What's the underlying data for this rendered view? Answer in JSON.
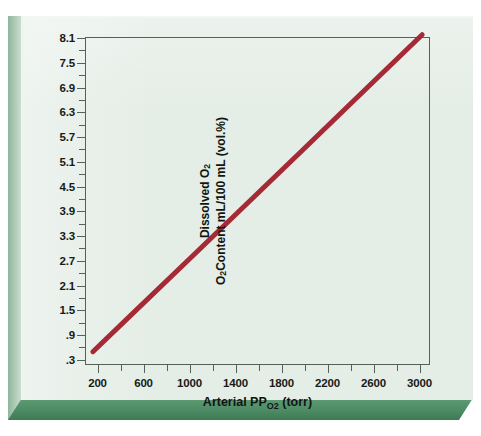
{
  "figure": {
    "background_color": "#e4ede6",
    "bevel_color": "#4b8a63",
    "frame_color": "#54605a"
  },
  "chart_data": {
    "type": "line",
    "title": "",
    "xlabel": "Arterial PO2 (torr)",
    "ylabel": "Dissolved O2 / O2 Content mL/100 mL (vol.%)",
    "ylabel_line1": "Dissolved O",
    "ylabel_line1_sub": "2",
    "ylabel_line2_pre": "O",
    "ylabel_line2_sub": "2",
    "ylabel_line2_post": " Content mL/100 mL (vol.%)",
    "xlabel_pre": "Arterial P",
    "xlabel_sub": "O2",
    "xlabel_post": " (torr)",
    "xlim": [
      100,
      3100
    ],
    "ylim": [
      0.15,
      8.1
    ],
    "xticks": [
      200,
      400,
      600,
      800,
      1000,
      1200,
      1400,
      1600,
      1800,
      2000,
      2200,
      2400,
      2600,
      2800,
      3000
    ],
    "xtick_labels": [
      "200",
      "",
      "600",
      "",
      "1000",
      "",
      "1400",
      "",
      "1800",
      "",
      "2200",
      "",
      "2600",
      "",
      "3000"
    ],
    "yticks": [
      0.3,
      0.6,
      0.9,
      1.2,
      1.5,
      1.8,
      2.1,
      2.4,
      2.7,
      3.0,
      3.3,
      3.6,
      3.9,
      4.2,
      4.5,
      4.8,
      5.1,
      5.4,
      5.7,
      6.0,
      6.3,
      6.6,
      6.9,
      7.2,
      7.5,
      7.8,
      8.1
    ],
    "ytick_labels": [
      ".3",
      "",
      ".9",
      "",
      "1.5",
      "",
      "2.1",
      "",
      "2.7",
      "",
      "3.3",
      "",
      "3.9",
      "",
      "4.5",
      "",
      "5.1",
      "",
      "5.7",
      "",
      "6.3",
      "",
      "6.9",
      "",
      "7.5",
      "",
      "8.1"
    ],
    "grid": false,
    "legend": "none",
    "series": [
      {
        "name": "Dissolved O2 content",
        "color": "#a52a35",
        "line_width": 5,
        "x": [
          160,
          500,
          1000,
          1500,
          2000,
          2500,
          3040
        ],
        "y": [
          0.45,
          1.36,
          2.7,
          4.04,
          5.38,
          6.73,
          8.18
        ]
      }
    ],
    "relationship": "Linear: dissolved O2 content is directly proportional to arterial PO2 (Henry's law), slope approx 0.003 mL O2 per 100 mL blood per torr."
  }
}
